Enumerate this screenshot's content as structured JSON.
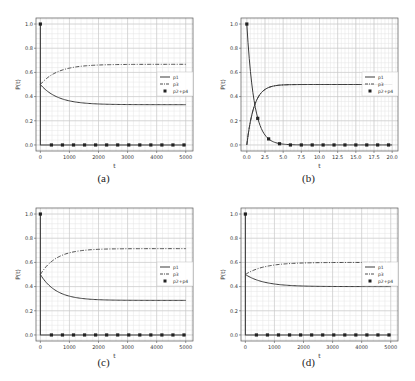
{
  "chart_data": [
    {
      "id": "a",
      "type": "line",
      "caption": "(a)",
      "xlabel": "t",
      "ylabel": "P(t)",
      "xlim": [
        -150,
        5250
      ],
      "ylim": [
        -0.05,
        1.05
      ],
      "xticks": [
        0,
        1000,
        2000,
        3000,
        4000,
        5000
      ],
      "xtick_labels": [
        "0",
        "1000",
        "2000",
        "3000",
        "4000",
        "5000"
      ],
      "yticks": [
        0.0,
        0.2,
        0.4,
        0.6,
        0.8,
        1.0
      ],
      "ytick_labels": [
        "0.0",
        "0.2",
        "0.4",
        "0.6",
        "0.8",
        "1.0"
      ],
      "grid": true,
      "legend_position": "center right",
      "legend": [
        "p1",
        "p3",
        "p2+p4"
      ],
      "model": {
        "kind": "slow",
        "t_end": 5000,
        "p1_end": 0.333,
        "p3_end": 0.667,
        "tau": 600
      },
      "series": [
        {
          "name": "p1",
          "style": "solid",
          "start": 0.5,
          "end": 0.333
        },
        {
          "name": "p3",
          "style": "dashdot",
          "start": 0.5,
          "end": 0.667
        },
        {
          "name": "p2+p4",
          "style": "markers",
          "start": 1.0,
          "end": 0.0,
          "marker_x": [
            0,
            380,
            760,
            1140,
            1520,
            1900,
            2280,
            2660,
            3040,
            3420,
            3800,
            4180,
            4560,
            4940
          ]
        }
      ]
    },
    {
      "id": "b",
      "type": "line",
      "caption": "(b)",
      "xlabel": "t",
      "ylabel": "P(t)",
      "xlim": [
        -0.8,
        20.8
      ],
      "ylim": [
        -0.05,
        1.05
      ],
      "xticks": [
        0.0,
        2.5,
        5.0,
        7.5,
        10.0,
        12.5,
        15.0,
        17.5,
        20.0
      ],
      "xtick_labels": [
        "0.0",
        "2.5",
        "5.0",
        "7.5",
        "10.0",
        "12.5",
        "15.0",
        "17.5",
        "20.0"
      ],
      "yticks": [
        0.0,
        0.2,
        0.4,
        0.6,
        0.8,
        1.0
      ],
      "ytick_labels": [
        "0.0",
        "0.2",
        "0.4",
        "0.6",
        "0.8",
        "1.0"
      ],
      "grid": true,
      "legend_position": "center right",
      "legend": [
        "p1",
        "p3",
        "p2+p4"
      ],
      "model": {
        "kind": "fast",
        "t_end": 20,
        "p1_end": 0.5,
        "p3_end": 0.5,
        "tau": 1.0
      },
      "series": [
        {
          "name": "p1",
          "style": "solid",
          "start": 0.0,
          "end": 0.5
        },
        {
          "name": "p3",
          "style": "dashdot",
          "start": 0.0,
          "end": 0.5
        },
        {
          "name": "p2+p4",
          "style": "markers",
          "start": 1.0,
          "end": 0.0,
          "marker_x": [
            0.0,
            1.5,
            3.0,
            4.5,
            6.0,
            7.5,
            9.0,
            10.5,
            12.0,
            13.5,
            15.0,
            16.5,
            18.0,
            19.5
          ],
          "marker_y": [
            1.0,
            0.22,
            0.05,
            0.01,
            0.0,
            0.0,
            0.0,
            0.0,
            0.0,
            0.0,
            0.0,
            0.0,
            0.0,
            0.0
          ]
        }
      ]
    },
    {
      "id": "c",
      "type": "line",
      "caption": "(c)",
      "xlabel": "t",
      "ylabel": "P(t)",
      "xlim": [
        -150,
        5250
      ],
      "ylim": [
        -0.05,
        1.05
      ],
      "xticks": [
        0,
        1000,
        2000,
        3000,
        4000,
        5000
      ],
      "xtick_labels": [
        "0",
        "1000",
        "2000",
        "3000",
        "4000",
        "5000"
      ],
      "yticks": [
        0.0,
        0.2,
        0.4,
        0.6,
        0.8,
        1.0
      ],
      "ytick_labels": [
        "0.0",
        "0.2",
        "0.4",
        "0.6",
        "0.8",
        "1.0"
      ],
      "grid": true,
      "legend_position": "center right",
      "legend": [
        "p1",
        "p3",
        "p2+p4"
      ],
      "model": {
        "kind": "slow",
        "t_end": 5000,
        "p1_end": 0.286,
        "p3_end": 0.714,
        "tau": 550
      },
      "series": [
        {
          "name": "p1",
          "style": "solid",
          "start": 0.5,
          "end": 0.286
        },
        {
          "name": "p3",
          "style": "dashdot",
          "start": 0.5,
          "end": 0.714
        },
        {
          "name": "p2+p4",
          "style": "markers",
          "start": 1.0,
          "end": 0.0,
          "marker_x": [
            0,
            380,
            760,
            1140,
            1520,
            1900,
            2280,
            2660,
            3040,
            3420,
            3800,
            4180,
            4560,
            4940
          ]
        }
      ]
    },
    {
      "id": "d",
      "type": "line",
      "caption": "(d)",
      "xlabel": "t",
      "ylabel": "P(t)",
      "xlim": [
        -150,
        5250
      ],
      "ylim": [
        -0.05,
        1.05
      ],
      "xticks": [
        0,
        1000,
        2000,
        3000,
        4000,
        5000
      ],
      "xtick_labels": [
        "0",
        "1000",
        "2000",
        "3000",
        "4000",
        "5000"
      ],
      "yticks": [
        0.0,
        0.2,
        0.4,
        0.6,
        0.8,
        1.0
      ],
      "ytick_labels": [
        "0.0",
        "0.2",
        "0.4",
        "0.6",
        "0.8",
        "1.0"
      ],
      "grid": true,
      "legend_position": "center right",
      "legend": [
        "p1",
        "p3",
        "p2+p4"
      ],
      "model": {
        "kind": "slow",
        "t_end": 5000,
        "p1_end": 0.4,
        "p3_end": 0.6,
        "tau": 650
      },
      "series": [
        {
          "name": "p1",
          "style": "solid",
          "start": 0.5,
          "end": 0.4
        },
        {
          "name": "p3",
          "style": "dashdot",
          "start": 0.5,
          "end": 0.6
        },
        {
          "name": "p2+p4",
          "style": "markers",
          "start": 1.0,
          "end": 0.0,
          "marker_x": [
            0,
            380,
            760,
            1140,
            1520,
            1900,
            2280,
            2660,
            3040,
            3420,
            3800,
            4180,
            4560,
            4940
          ]
        }
      ]
    }
  ],
  "colors": {
    "line": "#3a3a3a",
    "grid_major": "#c8c8c8",
    "grid_minor": "#e4e4e4",
    "frame": "#555555",
    "text": "#333333"
  }
}
